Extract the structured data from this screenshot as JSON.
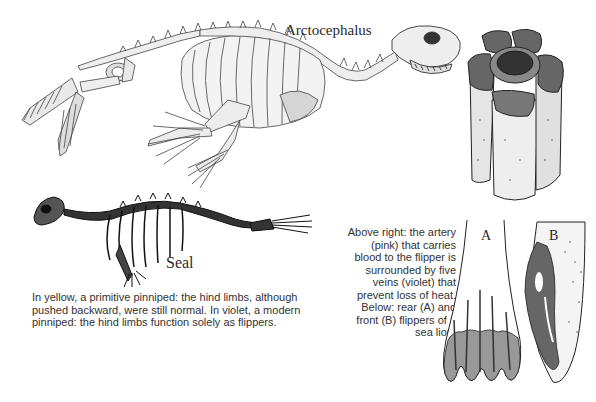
{
  "labels": {
    "arctocephalus": "Arctocephalus",
    "seal": "Seal",
    "flipper_a": "A",
    "flipper_b": "B"
  },
  "captions": {
    "left_lines": [
      "In yellow, a primitive pinniped: the hind limbs, although",
      "pushed backward, were still normal. In violet, a modern",
      "pinniped: the hind limbs function solely as flippers."
    ],
    "right_lines": [
      "Above right: the artery",
      "(pink) that carries",
      "blood to the flipper is",
      "surrounded by five",
      "veins (violet) that",
      "prevent loss of heat.",
      "Below: rear (A) and",
      "front (B) flippers of a",
      "sea lion."
    ]
  },
  "illustrations": {
    "arctocephalus_skeleton": "primitive pinniped skeleton (Arctocephalus)",
    "seal_skeleton": "modern seal skeleton",
    "vessel_bundle": "artery surrounded by five veins",
    "rear_flipper": "rear flipper (A)",
    "front_flipper": "front flipper (B)"
  },
  "colors": {
    "background": "#ffffff",
    "ink": "#2a2a2a",
    "bone": "#e6e6e6",
    "shade": "#8a8a8a",
    "dark": "#3a3a3a"
  }
}
